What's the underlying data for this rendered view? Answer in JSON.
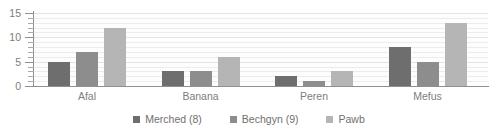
{
  "chart_data": {
    "type": "bar",
    "title": "",
    "xlabel": "",
    "ylabel": "",
    "categories": [
      "Afal",
      "Banana",
      "Peren",
      "Mefus"
    ],
    "series": [
      {
        "name": "Merched (8)",
        "color": "#6e6e6e",
        "values": [
          5,
          3,
          2,
          8
        ]
      },
      {
        "name": "Bechgyn (9)",
        "color": "#8d8d8d",
        "values": [
          7,
          3,
          1,
          5
        ]
      },
      {
        "name": "Pawb",
        "color": "#b5b5b5",
        "values": [
          12,
          6,
          3,
          13
        ]
      }
    ],
    "ylim": [
      0,
      15
    ],
    "y_ticks": [
      0,
      5,
      10,
      15
    ],
    "y_tick_labels": [
      "0",
      "5",
      "10",
      "15"
    ],
    "y_minor_tick_step": 1,
    "grid": true,
    "grid_step": 1,
    "legend_position": "bottom"
  },
  "axis": {
    "y_labels": [
      "15",
      "10",
      "5",
      "0"
    ]
  },
  "legend": {
    "items": [
      {
        "label": "Merched (8)"
      },
      {
        "label": "Bechgyn (9)"
      },
      {
        "label": "Pawb"
      }
    ]
  }
}
